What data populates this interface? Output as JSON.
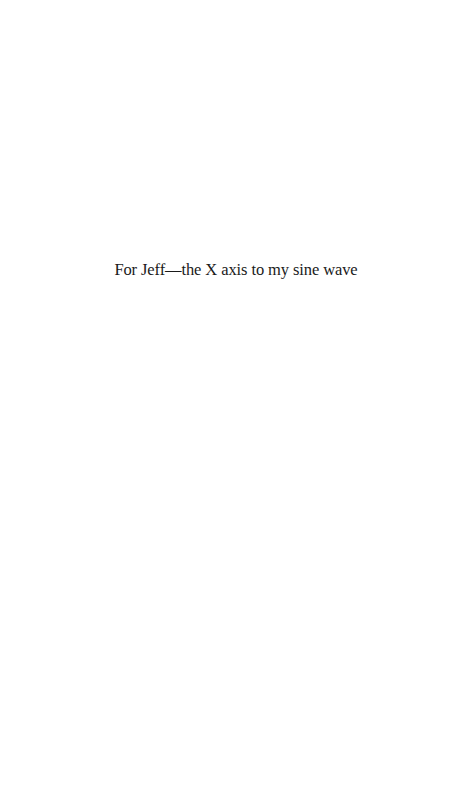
{
  "page": {
    "background": "#ffffff",
    "text_color": "#1a1a1a"
  },
  "dedication": {
    "text": "For Jeff—the X axis to my sine wave"
  }
}
